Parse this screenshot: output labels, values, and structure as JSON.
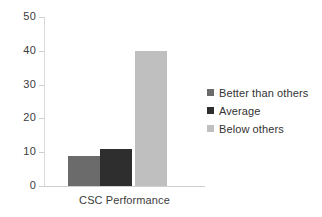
{
  "chart_data": {
    "type": "bar",
    "title": "",
    "subtitle": "",
    "xlabel": "CSC Performance",
    "ylabel": "",
    "categories": [
      "CSC Performance"
    ],
    "series": [
      {
        "name": "Better than others",
        "values": [
          9
        ],
        "color": "#6b6b6b"
      },
      {
        "name": "Average",
        "values": [
          11
        ],
        "color": "#2e2e2e"
      },
      {
        "name": "Below others",
        "values": [
          40
        ],
        "color": "#bfbfbf"
      }
    ],
    "ylim": [
      0,
      50
    ],
    "yticks": [
      0,
      10,
      20,
      30,
      40,
      50
    ],
    "ytick_labels": [
      "0",
      "10",
      "20",
      "30",
      "40",
      "50"
    ],
    "xtick_labels": [
      "CSC Performance"
    ],
    "grid": false,
    "legend_position": "right",
    "background": "#ffffff"
  },
  "axis": {
    "y_labels": [
      {
        "text": "50",
        "value": 50
      },
      {
        "text": "40",
        "value": 40
      },
      {
        "text": "30",
        "value": 30
      },
      {
        "text": "20",
        "value": 20
      },
      {
        "text": "10",
        "value": 10
      },
      {
        "text": "0",
        "value": 0
      }
    ],
    "x_label": "CSC Performance"
  },
  "legend": {
    "items": [
      {
        "label": "Better than others",
        "color": "#6b6b6b"
      },
      {
        "label": "Average",
        "color": "#2e2e2e"
      },
      {
        "label": "Below others",
        "color": "#bfbfbf"
      }
    ]
  }
}
